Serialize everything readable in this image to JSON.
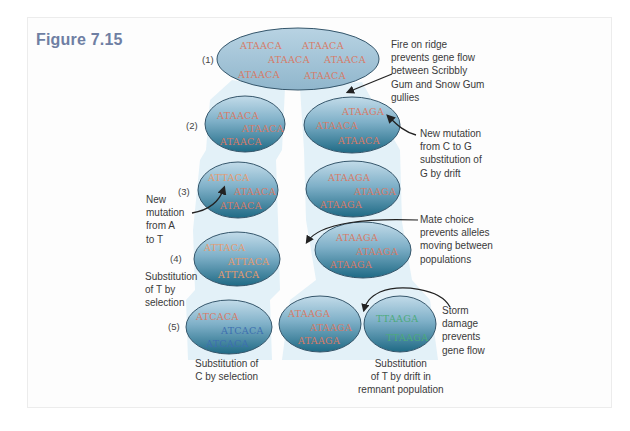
{
  "figure": {
    "title": "Figure 7.15"
  },
  "colors": {
    "ellipse_top": "#b3d3e6",
    "ellipse_bottom": "#1f6a85",
    "ellipse_stroke": "#35566b",
    "corridor": "#dcedf6",
    "base_A": "#d77a66",
    "base_T": "#e59a6f",
    "base_C": "#3d6fb0",
    "base_G": "#1f5a66",
    "base_T_green": "#4caa7a",
    "title": "#6f7fa3"
  },
  "generations": [
    "(1)",
    "(2)",
    "(3)",
    "(4)",
    "(5)"
  ],
  "ellipses": {
    "gen1": [
      "ATAACA",
      "ATAACA",
      "ATAACA",
      "ATAACA",
      "ATAACA",
      "ATAACA"
    ],
    "gen2_left": [
      "ATAACA",
      "ATAACA",
      "ATAACA"
    ],
    "gen2_right": [
      "ATAAGA",
      "ATAACA",
      "ATAACA"
    ],
    "gen3_left": [
      "ATTACA",
      "ATAACA",
      "ATAACA"
    ],
    "gen3_right": [
      "ATAAGA",
      "ATAAGA",
      "ATAAGA"
    ],
    "gen4_left": [
      "ATTACA",
      "ATTACA",
      "ATTACA"
    ],
    "gen4_right": [
      "ATAAGA",
      "ATAAGA",
      "ATAAGA"
    ],
    "gen5_left": [
      "ATCACA",
      "ATCACA",
      "ATCACA"
    ],
    "gen5_middle": [
      "ATAAGA",
      "ATAAGA",
      "ATAAGA"
    ],
    "gen5_right": [
      "TTAAGA",
      "TTAAGA"
    ]
  },
  "annotations": {
    "fire": "Fire on ridge\nprevents gene flow\nbetween Scribbly\nGum and Snow Gum\ngullies",
    "mutation_c_to_g": "New mutation\nfrom C to G\nsubstitution of\nG by drift",
    "mutation_a_to_t": "New\nmutation\nfrom A\nto T",
    "mate_choice": "Mate choice\nprevents alleles\nmoving between\npopulations",
    "substitution_t_selection": "Substitution\nof T by\nselection",
    "storm": "Storm\ndamage\nprevents\ngene flow",
    "substitution_c_selection": "Substitution of\nC by selection",
    "substitution_t_drift": "Substitution\nof T by drift in\nremnant population"
  }
}
